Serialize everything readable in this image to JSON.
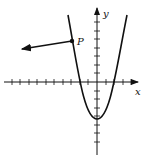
{
  "diagram": {
    "type": "coordinate-graph",
    "axes": {
      "x_label": "x",
      "y_label": "y",
      "x_ticks": [
        -11,
        -10,
        -9,
        -8,
        -7,
        -6,
        -5,
        -4,
        -3,
        -2,
        -1,
        1,
        2,
        3,
        4
      ],
      "y_ticks": [
        -7,
        -6,
        -5,
        -4,
        -3,
        -2,
        -1,
        1,
        2,
        3,
        4,
        5,
        6,
        7
      ]
    },
    "curve": {
      "kind": "parabola",
      "vertex": [
        0,
        -4.5
      ],
      "roots": [
        -2,
        2
      ],
      "opens": "up"
    },
    "point": {
      "label": "P",
      "position": [
        -3,
        4.8
      ]
    },
    "vector": {
      "from": "P",
      "direction": "left-slightly-down",
      "arrow": true
    },
    "colors": {
      "ink": "#111111",
      "background": "#ffffff"
    }
  }
}
